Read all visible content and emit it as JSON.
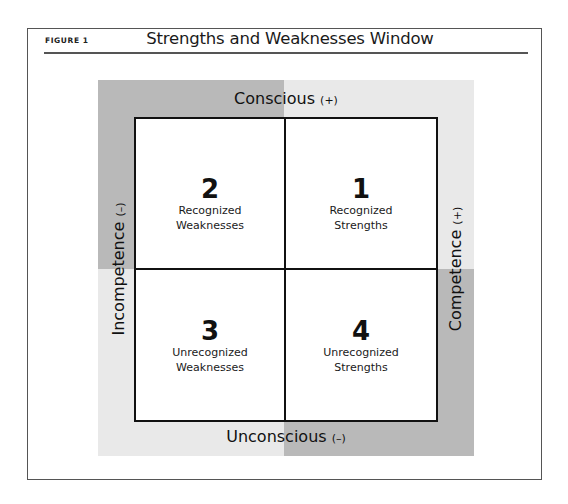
{
  "figure": {
    "label": "FIGURE 1",
    "title": "Strengths and Weaknesses Window"
  },
  "axes": {
    "top": {
      "label": "Conscious",
      "sign": "(+)"
    },
    "bottom": {
      "label": "Unconscious",
      "sign": "(–)"
    },
    "left": {
      "label": "Incompetence",
      "sign": "(–)"
    },
    "right": {
      "label": "Competence",
      "sign": "(+)"
    }
  },
  "colors": {
    "dark_gray": "#b9b9b9",
    "light_gray": "#e9e9e9",
    "grid_line": "#111111"
  },
  "quadrants": [
    {
      "position": "top-left",
      "number": "2",
      "line1": "Recognized",
      "line2": "Weaknesses"
    },
    {
      "position": "top-right",
      "number": "1",
      "line1": "Recognized",
      "line2": "Strengths"
    },
    {
      "position": "bottom-left",
      "number": "3",
      "line1": "Unrecognized",
      "line2": "Weaknesses"
    },
    {
      "position": "bottom-right",
      "number": "4",
      "line1": "Unrecognized",
      "line2": "Strengths"
    }
  ]
}
